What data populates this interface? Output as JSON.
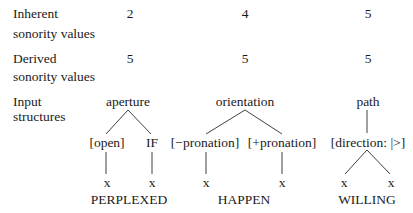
{
  "rows": {
    "inherent": {
      "label_line1": "Inherent",
      "label_line2": "sonority values",
      "values": [
        "2",
        "4",
        "5"
      ]
    },
    "derived": {
      "label_line1": "Derived",
      "label_line2": "sonority values",
      "values": [
        "5",
        "5",
        "5"
      ]
    },
    "input": {
      "label_line1": "Input",
      "label_line2": "structures"
    }
  },
  "trees": [
    {
      "root": "aperture",
      "features": [
        "[open]",
        "IF"
      ],
      "slots": [
        "x",
        "x"
      ],
      "word": "PERPLEXED"
    },
    {
      "root": "orientation",
      "features": [
        "[−pronation]",
        "[+pronation]"
      ],
      "slots": [
        "x",
        "x"
      ],
      "word": "HAPPEN"
    },
    {
      "root": "path",
      "features": [
        "[direction: |>]"
      ],
      "slots": [
        "x",
        "x"
      ],
      "word": "WILLING"
    }
  ]
}
